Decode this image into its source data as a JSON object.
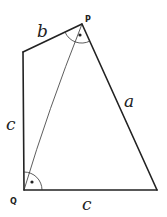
{
  "diagram": {
    "type": "quadrilateral-with-diagonal",
    "vertices": {
      "P": {
        "label": "P",
        "x": 82,
        "y": 24
      },
      "Q": {
        "label": "Q",
        "x": 24,
        "y": 190
      },
      "top_left": {
        "x": 23,
        "y": 52
      },
      "bottom_right": {
        "x": 157,
        "y": 190
      }
    },
    "sides": {
      "top": {
        "label": "b"
      },
      "right": {
        "label": "a"
      },
      "left": {
        "label": "c"
      },
      "bottom": {
        "label": "c"
      }
    },
    "angle_marks": [
      {
        "at": "P",
        "style": "arc-with-dot"
      },
      {
        "at": "Q",
        "style": "arc-with-dot"
      }
    ],
    "stroke_color": "#222222",
    "background": "#ffffff"
  }
}
